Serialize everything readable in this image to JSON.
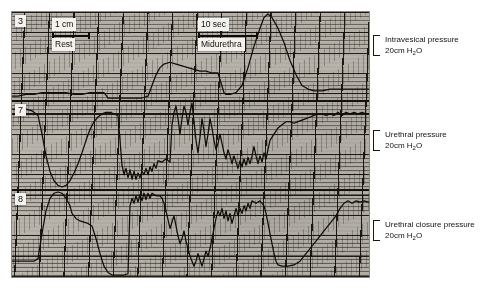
{
  "figure": {
    "type": "urodynamic-recording",
    "paper_background": "#b9b5ad",
    "trace_color": "#100c08"
  },
  "paper_labels": {
    "scale_amplitude": "1 cm",
    "scale_time": "10 sec",
    "state_rest": "Rest",
    "state_midurethra": "Midurethra"
  },
  "channels": [
    {
      "number": "3",
      "name": "Intravesical pressure",
      "scale": "20cm H",
      "scale_sub": "2",
      "scale_tail": "O"
    },
    {
      "number": "7",
      "name": "Urethral pressure",
      "scale": "20cm H",
      "scale_sub": "2",
      "scale_tail": "O"
    },
    {
      "number": "8",
      "name": "Urethral closure pressure",
      "scale": "20cm H",
      "scale_sub": "2",
      "scale_tail": "O"
    }
  ],
  "chart_data": {
    "type": "line",
    "title": "",
    "xlabel": "",
    "ylabel": "",
    "grid": true,
    "legend": "none",
    "x_units": "seconds (10 sec scale bar shown)",
    "y_units": "cm H2O (20 cm H2O bracket per channel)",
    "annotations": [
      {
        "text": "1 cm",
        "role": "amplitude-scale-bar"
      },
      {
        "text": "10 sec",
        "role": "time-scale-bar"
      },
      {
        "text": "Rest",
        "role": "phase-label"
      },
      {
        "text": "Midurethra",
        "role": "phase-label"
      }
    ],
    "series": [
      {
        "name": "Intravesical pressure",
        "channel": "3",
        "panel": 1,
        "description": "Flat baseline at rest with a small step, then two rounded pressure rises during straining.",
        "points": [
          [
            0,
            6
          ],
          [
            6,
            6
          ],
          [
            14,
            6.5
          ],
          [
            22,
            6.5
          ],
          [
            30,
            7
          ],
          [
            38,
            7
          ],
          [
            46,
            7
          ],
          [
            54,
            7
          ],
          [
            62,
            6.5
          ],
          [
            70,
            6.5
          ],
          [
            78,
            7
          ],
          [
            86,
            7
          ],
          [
            92,
            7
          ],
          [
            96,
            5.5
          ],
          [
            100,
            5.5
          ],
          [
            108,
            5.5
          ],
          [
            116,
            5.5
          ],
          [
            124,
            5.5
          ],
          [
            130,
            5.5
          ],
          [
            136,
            6
          ],
          [
            140,
            9
          ],
          [
            144,
            12
          ],
          [
            148,
            14
          ],
          [
            152,
            15
          ],
          [
            158,
            15.5
          ],
          [
            164,
            15
          ],
          [
            170,
            14.5
          ],
          [
            176,
            14
          ],
          [
            182,
            13.5
          ],
          [
            188,
            13
          ],
          [
            194,
            13
          ],
          [
            200,
            12.5
          ],
          [
            206,
            12.5
          ],
          [
            212,
            7
          ],
          [
            214,
            6.5
          ],
          [
            218,
            6.5
          ],
          [
            224,
            7
          ],
          [
            230,
            9
          ],
          [
            236,
            14
          ],
          [
            242,
            20
          ],
          [
            248,
            25
          ],
          [
            252,
            28
          ],
          [
            256,
            29
          ],
          [
            260,
            28
          ],
          [
            266,
            25
          ],
          [
            272,
            21
          ],
          [
            278,
            16
          ],
          [
            284,
            12
          ],
          [
            290,
            9
          ],
          [
            296,
            8
          ],
          [
            302,
            7.5
          ],
          [
            310,
            7.5
          ],
          [
            318,
            8
          ],
          [
            326,
            8
          ],
          [
            334,
            8
          ],
          [
            342,
            8
          ],
          [
            350,
            8
          ],
          [
            357,
            8
          ]
        ]
      },
      {
        "name": "Urethral pressure",
        "channel": "7",
        "panel": 2,
        "description": "Large rounded urethral pressure profile peak at rest, a plateau, then marked oscillations with deep dips during straining and a gradual recovery.",
        "points": [
          [
            0,
            68
          ],
          [
            6,
            68
          ],
          [
            14,
            68
          ],
          [
            20,
            67
          ],
          [
            26,
            64
          ],
          [
            30,
            52
          ],
          [
            34,
            38
          ],
          [
            38,
            28
          ],
          [
            42,
            22
          ],
          [
            46,
            19
          ],
          [
            50,
            18
          ],
          [
            54,
            19
          ],
          [
            58,
            22
          ],
          [
            62,
            27
          ],
          [
            66,
            33
          ],
          [
            70,
            40
          ],
          [
            74,
            48
          ],
          [
            78,
            55
          ],
          [
            82,
            60
          ],
          [
            86,
            63
          ],
          [
            90,
            65
          ],
          [
            94,
            66
          ],
          [
            98,
            66
          ],
          [
            102,
            65
          ],
          [
            106,
            64
          ],
          [
            110,
            32
          ],
          [
            112,
            26
          ],
          [
            114,
            30
          ],
          [
            116,
            24
          ],
          [
            118,
            29
          ],
          [
            120,
            23
          ],
          [
            122,
            28
          ],
          [
            124,
            23
          ],
          [
            126,
            27
          ],
          [
            128,
            24
          ],
          [
            130,
            28
          ],
          [
            132,
            26
          ],
          [
            134,
            30
          ],
          [
            136,
            26
          ],
          [
            138,
            31
          ],
          [
            140,
            28
          ],
          [
            142,
            33
          ],
          [
            144,
            30
          ],
          [
            146,
            35
          ],
          [
            150,
            34
          ],
          [
            154,
            36
          ],
          [
            158,
            34
          ],
          [
            160,
            58
          ],
          [
            162,
            66
          ],
          [
            164,
            70
          ],
          [
            166,
            62
          ],
          [
            168,
            52
          ],
          [
            170,
            62
          ],
          [
            172,
            70
          ],
          [
            174,
            66
          ],
          [
            176,
            58
          ],
          [
            178,
            66
          ],
          [
            180,
            72
          ],
          [
            182,
            60
          ],
          [
            184,
            48
          ],
          [
            186,
            40
          ],
          [
            188,
            50
          ],
          [
            190,
            62
          ],
          [
            192,
            54
          ],
          [
            194,
            44
          ],
          [
            196,
            52
          ],
          [
            198,
            62
          ],
          [
            200,
            56
          ],
          [
            202,
            48
          ],
          [
            204,
            42
          ],
          [
            206,
            46
          ],
          [
            208,
            52
          ],
          [
            210,
            46
          ],
          [
            212,
            40
          ],
          [
            214,
            36
          ],
          [
            216,
            42
          ],
          [
            218,
            38
          ],
          [
            220,
            33
          ],
          [
            222,
            38
          ],
          [
            224,
            34
          ],
          [
            226,
            30
          ],
          [
            228,
            35
          ],
          [
            230,
            31
          ],
          [
            232,
            36
          ],
          [
            234,
            32
          ],
          [
            236,
            37
          ],
          [
            238,
            33
          ],
          [
            240,
            38
          ],
          [
            242,
            44
          ],
          [
            244,
            38
          ],
          [
            246,
            33
          ],
          [
            248,
            38
          ],
          [
            250,
            34
          ],
          [
            252,
            40
          ],
          [
            254,
            36
          ],
          [
            256,
            42
          ],
          [
            258,
            48
          ],
          [
            262,
            52
          ],
          [
            266,
            56
          ],
          [
            270,
            58
          ],
          [
            274,
            60
          ],
          [
            278,
            60
          ],
          [
            282,
            59
          ],
          [
            286,
            60
          ],
          [
            290,
            61
          ],
          [
            294,
            62
          ],
          [
            298,
            63
          ],
          [
            302,
            64
          ],
          [
            306,
            65
          ],
          [
            310,
            65
          ],
          [
            314,
            64
          ],
          [
            318,
            65
          ],
          [
            322,
            64
          ],
          [
            326,
            66
          ],
          [
            330,
            64
          ],
          [
            334,
            66
          ],
          [
            338,
            65
          ],
          [
            342,
            66
          ],
          [
            346,
            65
          ],
          [
            350,
            66
          ],
          [
            354,
            65
          ],
          [
            357,
            65
          ]
        ]
      },
      {
        "name": "Urethral closure pressure",
        "channel": "8",
        "panel": 3,
        "description": "High closure pressure peak at rest that falls steeply, deep negative excursions with rapid oscillations during straining, then a slow return toward baseline.",
        "points": [
          [
            0,
            12
          ],
          [
            8,
            12
          ],
          [
            16,
            12
          ],
          [
            22,
            12
          ],
          [
            26,
            14
          ],
          [
            30,
            34
          ],
          [
            34,
            52
          ],
          [
            38,
            62
          ],
          [
            42,
            66
          ],
          [
            46,
            67
          ],
          [
            50,
            66
          ],
          [
            54,
            62
          ],
          [
            58,
            56
          ],
          [
            60,
            50
          ],
          [
            64,
            46
          ],
          [
            68,
            44
          ],
          [
            72,
            43
          ],
          [
            76,
            42
          ],
          [
            80,
            40
          ],
          [
            84,
            30
          ],
          [
            88,
            18
          ],
          [
            92,
            8
          ],
          [
            96,
            3
          ],
          [
            100,
            1
          ],
          [
            106,
            1
          ],
          [
            112,
            1
          ],
          [
            116,
            2
          ],
          [
            118,
            56
          ],
          [
            120,
            62
          ],
          [
            122,
            58
          ],
          [
            124,
            64
          ],
          [
            126,
            59
          ],
          [
            128,
            65
          ],
          [
            130,
            60
          ],
          [
            132,
            66
          ],
          [
            134,
            61
          ],
          [
            136,
            66
          ],
          [
            138,
            62
          ],
          [
            140,
            66
          ],
          [
            144,
            64
          ],
          [
            148,
            64
          ],
          [
            150,
            62
          ],
          [
            152,
            58
          ],
          [
            154,
            52
          ],
          [
            156,
            45
          ],
          [
            158,
            38
          ],
          [
            160,
            43
          ],
          [
            162,
            48
          ],
          [
            164,
            40
          ],
          [
            166,
            32
          ],
          [
            168,
            26
          ],
          [
            170,
            30
          ],
          [
            172,
            36
          ],
          [
            174,
            28
          ],
          [
            176,
            22
          ],
          [
            178,
            16
          ],
          [
            180,
            12
          ],
          [
            182,
            8
          ],
          [
            184,
            12
          ],
          [
            186,
            18
          ],
          [
            188,
            13
          ],
          [
            190,
            8
          ],
          [
            192,
            14
          ],
          [
            194,
            20
          ],
          [
            196,
            16
          ],
          [
            198,
            22
          ],
          [
            200,
            30
          ],
          [
            202,
            38
          ],
          [
            204,
            46
          ],
          [
            206,
            52
          ],
          [
            208,
            48
          ],
          [
            210,
            54
          ],
          [
            212,
            46
          ],
          [
            214,
            52
          ],
          [
            216,
            44
          ],
          [
            218,
            50
          ],
          [
            220,
            42
          ],
          [
            222,
            48
          ],
          [
            224,
            54
          ],
          [
            226,
            48
          ],
          [
            228,
            54
          ],
          [
            230,
            50
          ],
          [
            232,
            56
          ],
          [
            234,
            52
          ],
          [
            236,
            58
          ],
          [
            238,
            54
          ],
          [
            240,
            60
          ],
          [
            244,
            58
          ],
          [
            248,
            60
          ],
          [
            252,
            56
          ],
          [
            254,
            50
          ],
          [
            256,
            42
          ],
          [
            258,
            34
          ],
          [
            260,
            26
          ],
          [
            262,
            18
          ],
          [
            264,
            12
          ],
          [
            266,
            9
          ],
          [
            270,
            8
          ],
          [
            276,
            8
          ],
          [
            282,
            9
          ],
          [
            288,
            12
          ],
          [
            294,
            18
          ],
          [
            300,
            24
          ],
          [
            306,
            30
          ],
          [
            312,
            36
          ],
          [
            318,
            42
          ],
          [
            324,
            48
          ],
          [
            328,
            54
          ],
          [
            332,
            58
          ],
          [
            336,
            60
          ],
          [
            340,
            58
          ],
          [
            344,
            60
          ],
          [
            348,
            59
          ],
          [
            352,
            60
          ],
          [
            357,
            59
          ]
        ]
      }
    ]
  }
}
